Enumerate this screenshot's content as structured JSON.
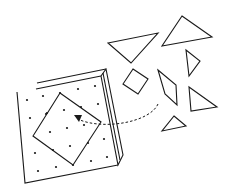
{
  "diagram": {
    "stroke_color": "#1a1a1a",
    "background": "#ffffff",
    "board": {
      "label": "geoboard",
      "pegs": 24
    },
    "square_on_board": {
      "label": "assembled-square"
    },
    "loose_pieces": [
      {
        "name": "large-triangle-1",
        "shape": "triangle"
      },
      {
        "name": "large-triangle-2",
        "shape": "triangle"
      },
      {
        "name": "small-triangle-1",
        "shape": "triangle"
      },
      {
        "name": "small-triangle-2",
        "shape": "triangle"
      },
      {
        "name": "medium-triangle",
        "shape": "triangle"
      },
      {
        "name": "square-piece",
        "shape": "square"
      },
      {
        "name": "parallelogram-piece",
        "shape": "parallelogram"
      }
    ],
    "arrow": {
      "style": "dashed",
      "direction": "pieces-to-board"
    }
  }
}
